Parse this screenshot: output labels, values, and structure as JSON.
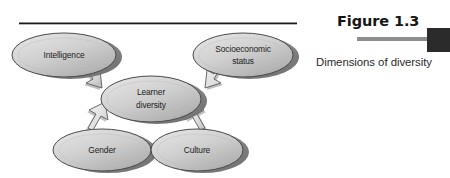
{
  "figure": {
    "number_label": "Figure 1.3",
    "caption": "Dimensions of diversity",
    "background_color": "#ffffff",
    "rule_color": "#1a1a1a",
    "accent_bar_color": "#8e8e8e",
    "tab_color": "#2b2b2b"
  },
  "diagram": {
    "type": "concept-map",
    "center_node": {
      "id": "learner-diversity",
      "line1": "Learner",
      "line2": "diversity"
    },
    "nodes": [
      {
        "id": "intelligence",
        "line1": "Intelligence",
        "line2": "",
        "position": "top-left"
      },
      {
        "id": "socioeconomic-status",
        "line1": "Socioeconomic",
        "line2": "status",
        "position": "top-right"
      },
      {
        "id": "gender",
        "line1": "Gender",
        "line2": "",
        "position": "bottom-left"
      },
      {
        "id": "culture",
        "line1": "Culture",
        "line2": "",
        "position": "bottom-right"
      }
    ],
    "connections": [
      {
        "from": "intelligence",
        "to": "learner-diversity",
        "style": "block-arrow"
      },
      {
        "from": "socioeconomic-status",
        "to": "learner-diversity",
        "style": "block-arrow"
      },
      {
        "from": "gender",
        "to": "learner-diversity",
        "style": "block-arrow"
      },
      {
        "from": "culture",
        "to": "learner-diversity",
        "style": "block-arrow"
      }
    ],
    "node_fill_light": "#d9d9d9",
    "node_fill_dark": "#9a9a9a",
    "node_stroke": "#4a4a4a",
    "arrow_fill": "#e6e6e6",
    "arrow_stroke": "#5a5a5a"
  }
}
